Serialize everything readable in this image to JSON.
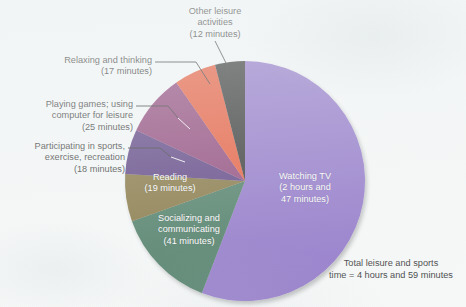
{
  "chart_data": {
    "type": "pie",
    "title": "",
    "subtitle": "",
    "total_label": "Total leisure and sports\ntime = 4 hours and 59 minutes",
    "total_minutes": 299,
    "units": "minutes",
    "legend": "none",
    "start_angle_deg": 0,
    "direction": "clockwise",
    "categories": [
      "Watching TV",
      "Socializing and communicating",
      "Reading",
      "Participating in sports, exercise, recreation",
      "Playing games; using computer for leisure",
      "Relaxing and thinking",
      "Other leisure activities"
    ],
    "values": [
      167,
      41,
      19,
      18,
      25,
      17,
      12
    ],
    "colors": [
      "#7c5cbe",
      "#2c6247",
      "#6d5a1f",
      "#3e1c6b",
      "#7a2060",
      "#e23a12",
      "#111111"
    ],
    "slices": [
      {
        "name": "Watching TV",
        "value": 167,
        "value_text": "2 hours and 47 minutes",
        "color": "#7c5cbe",
        "label_lines": [
          "Watching TV",
          "(2 hours and",
          "47 minutes)"
        ],
        "label_placement": "inside"
      },
      {
        "name": "Socializing and communicating",
        "value": 41,
        "value_text": "41 minutes",
        "color": "#2c6247",
        "label_lines": [
          "Socializing and",
          "communicating",
          "(41 minutes)"
        ],
        "label_placement": "inside"
      },
      {
        "name": "Reading",
        "value": 19,
        "value_text": "19 minutes",
        "color": "#6d5a1f",
        "label_lines": [
          "Reading",
          "(19 minutes)"
        ],
        "label_placement": "inside"
      },
      {
        "name": "Participating in sports, exercise, recreation",
        "value": 18,
        "value_text": "18 minutes",
        "color": "#3e1c6b",
        "label_lines": [
          "Participating in sports,",
          "exercise, recreation",
          "(18 minutes)"
        ],
        "label_placement": "callout-left"
      },
      {
        "name": "Playing games; using computer for leisure",
        "value": 25,
        "value_text": "25 minutes",
        "color": "#7a2060",
        "label_lines": [
          "Playing games; using",
          "computer for leisure",
          "(25 minutes)"
        ],
        "label_placement": "callout-left"
      },
      {
        "name": "Relaxing and thinking",
        "value": 17,
        "value_text": "17 minutes",
        "color": "#e23a12",
        "label_lines": [
          "Relaxing and thinking",
          "(17 minutes)"
        ],
        "label_placement": "callout-left"
      },
      {
        "name": "Other leisure activities",
        "value": 12,
        "value_text": "12 minutes",
        "color": "#111111",
        "label_lines": [
          "Other leisure",
          "activities",
          "(12 minutes)"
        ],
        "label_placement": "callout-top"
      }
    ]
  },
  "labels": {
    "other_leisure": "Other leisure\nactivities\n(12 minutes)",
    "relaxing": "Relaxing and thinking\n(17 minutes)",
    "playing_games": "Playing games; using\ncomputer for leisure\n(25 minutes)",
    "participating_sports": "Participating in sports,\nexercise, recreation\n(18 minutes)",
    "reading": "Reading\n(19 minutes)",
    "socializing": "Socializing and\ncommunicating\n(41 minutes)",
    "watching_tv": "Watching TV\n(2 hours and\n47 minutes)",
    "total": "Total leisure and sports\ntime = 4 hours and 59 minutes"
  }
}
